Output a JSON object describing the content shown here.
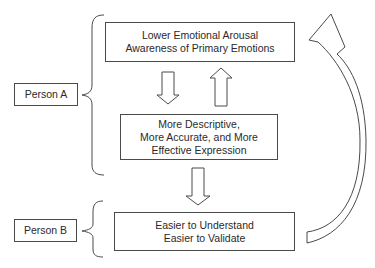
{
  "diagram": {
    "persons": [
      {
        "id": "person-a",
        "label": "Person A"
      },
      {
        "id": "person-b",
        "label": "Person B"
      }
    ],
    "boxes": {
      "top": {
        "lines": [
          "Lower Emotional Arousal",
          "Awareness of Primary Emotions"
        ]
      },
      "middle": {
        "lines": [
          "More Descriptive,",
          "More Accurate, and More",
          "Effective Expression"
        ]
      },
      "bottom": {
        "lines": [
          "Easier to Understand",
          "Easier to Validate"
        ]
      }
    },
    "arrows": [
      {
        "from": "top",
        "to": "middle",
        "direction": "down"
      },
      {
        "from": "middle",
        "to": "top",
        "direction": "up"
      },
      {
        "from": "middle",
        "to": "bottom",
        "direction": "down"
      },
      {
        "from": "bottom",
        "to": "top",
        "direction": "curved-feedback"
      }
    ],
    "colors": {
      "stroke": "#4a4a4a",
      "background": "#ffffff",
      "text": "#2a2a2a"
    }
  }
}
